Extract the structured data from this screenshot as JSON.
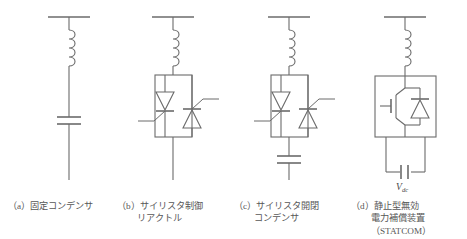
{
  "figure": {
    "background_color": "#ffffff",
    "line_color": "#6b6b6b",
    "text_color": "#575757",
    "panel_count": 4
  },
  "panels": [
    {
      "id": "a",
      "label": "（a）",
      "caption_lines": [
        "（a）固定コンデンサ"
      ],
      "components": [
        "bus-bar",
        "inductor",
        "capacitor"
      ]
    },
    {
      "id": "b",
      "label": "（b）",
      "caption_lines": [
        "（b）サイリスタ制御",
        "リアクトル"
      ],
      "components": [
        "bus-bar",
        "inductor",
        "thyristor-pair"
      ]
    },
    {
      "id": "c",
      "label": "（c）",
      "caption_lines": [
        "（c）サイリスタ開閉",
        "コンデンサ"
      ],
      "components": [
        "bus-bar",
        "inductor",
        "thyristor-pair",
        "capacitor"
      ]
    },
    {
      "id": "d",
      "label": "（d）",
      "caption_lines": [
        "（d）静止型無効",
        "電力補償装置",
        "（STATCOM）"
      ],
      "components": [
        "bus-bar",
        "inductor",
        "igbt-diode-module",
        "dc-capacitor"
      ],
      "dc_label": "V",
      "dc_label_sub": "dc"
    }
  ]
}
